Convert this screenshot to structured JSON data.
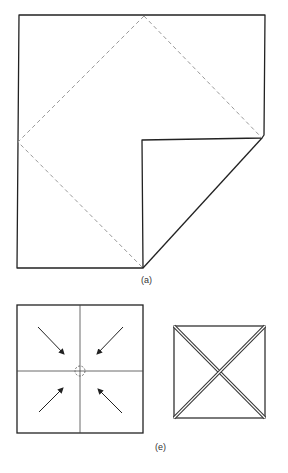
{
  "figure_a": {
    "label": "(a)",
    "description": "Square sheet with dashed diamond fold lines; bottom-right quadrant folded up to right-edge midpoint"
  },
  "figure_e": {
    "label": "(e)",
    "left_panel": "Square divided into quadrants with four arrows pointing to dashed center circle",
    "right_panel": "Square with doubled diagonal creases forming an X"
  },
  "colors": {
    "line": "#222222",
    "dashed": "#9a9a9a",
    "background": "#ffffff"
  }
}
